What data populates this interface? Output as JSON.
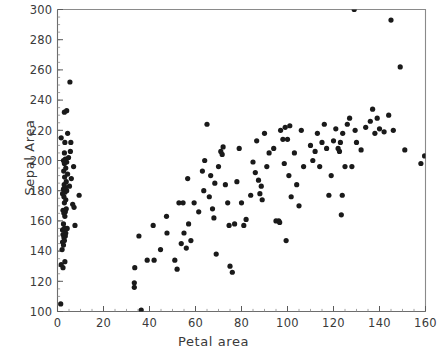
{
  "chart_data": {
    "type": "scatter",
    "title": "",
    "xlabel": "Petal area",
    "ylabel": "Sepal Area",
    "xlim": [
      0,
      160
    ],
    "ylim": [
      100,
      300
    ],
    "xticks": [
      0,
      20,
      40,
      60,
      80,
      100,
      120,
      140,
      160
    ],
    "yticks": [
      100,
      120,
      140,
      160,
      180,
      200,
      220,
      240,
      260,
      280,
      300
    ],
    "xtick_labels": [
      "0",
      "20",
      "40",
      "60",
      "80",
      "100",
      "120",
      "140",
      "160"
    ],
    "ytick_labels": [
      "100",
      "120",
      "140",
      "160",
      "180",
      "200",
      "220",
      "240",
      "260",
      "280",
      "300"
    ],
    "minor_tick_step_x": 5,
    "minor_tick_step_y": 5,
    "grid": false,
    "legend": null,
    "marker": "filled-circle",
    "marker_color": "#1a1a1a",
    "marker_size": 2.6,
    "frame_color": "#8a8a8a",
    "points": [
      [
        1.4,
        105
      ],
      [
        1.6,
        131
      ],
      [
        2.4,
        129
      ],
      [
        3.2,
        133
      ],
      [
        2.0,
        141
      ],
      [
        2.6,
        144
      ],
      [
        2.2,
        146
      ],
      [
        3.0,
        147
      ],
      [
        2.8,
        149
      ],
      [
        3.4,
        150
      ],
      [
        2.4,
        151
      ],
      [
        3.6,
        152
      ],
      [
        2.2,
        154
      ],
      [
        3.0,
        155
      ],
      [
        4.2,
        155
      ],
      [
        7.6,
        157
      ],
      [
        2.6,
        158
      ],
      [
        3.2,
        163
      ],
      [
        2.8,
        165
      ],
      [
        3.4,
        166
      ],
      [
        2.4,
        167
      ],
      [
        3.8,
        168
      ],
      [
        7.2,
        169
      ],
      [
        6.6,
        171
      ],
      [
        3.0,
        172
      ],
      [
        3.6,
        174
      ],
      [
        2.8,
        176
      ],
      [
        9.4,
        177
      ],
      [
        2.2,
        178
      ],
      [
        3.2,
        179
      ],
      [
        4.0,
        180
      ],
      [
        2.6,
        181
      ],
      [
        3.4,
        182
      ],
      [
        5.2,
        183
      ],
      [
        2.9,
        184
      ],
      [
        3.8,
        186
      ],
      [
        6.0,
        188
      ],
      [
        3.1,
        189
      ],
      [
        4.4,
        191
      ],
      [
        2.7,
        193
      ],
      [
        3.6,
        195
      ],
      [
        7.0,
        196
      ],
      [
        3.0,
        198
      ],
      [
        4.0,
        199
      ],
      [
        2.6,
        200
      ],
      [
        3.4,
        201
      ],
      [
        4.8,
        202
      ],
      [
        3.0,
        205
      ],
      [
        5.6,
        206
      ],
      [
        3.2,
        212
      ],
      [
        5.8,
        212
      ],
      [
        1.6,
        215
      ],
      [
        4.4,
        218
      ],
      [
        3.0,
        232
      ],
      [
        4.0,
        233
      ],
      [
        5.4,
        252
      ],
      [
        33.4,
        116
      ],
      [
        33.4,
        119
      ],
      [
        33.6,
        129
      ],
      [
        36.4,
        101
      ],
      [
        39.0,
        134
      ],
      [
        42.0,
        134
      ],
      [
        35.4,
        150
      ],
      [
        41.6,
        157
      ],
      [
        44.8,
        141
      ],
      [
        47.6,
        152
      ],
      [
        47.4,
        163
      ],
      [
        51.0,
        134
      ],
      [
        52.0,
        128
      ],
      [
        52.8,
        172
      ],
      [
        54.6,
        172
      ],
      [
        53.8,
        145
      ],
      [
        55.0,
        152
      ],
      [
        56.0,
        142
      ],
      [
        57.0,
        158
      ],
      [
        58.0,
        147
      ],
      [
        56.6,
        188
      ],
      [
        59.4,
        172
      ],
      [
        61.4,
        166
      ],
      [
        63.0,
        193
      ],
      [
        63.6,
        180
      ],
      [
        64.0,
        200
      ],
      [
        65.0,
        224
      ],
      [
        66.0,
        176
      ],
      [
        66.6,
        190
      ],
      [
        67.4,
        168
      ],
      [
        68.0,
        162
      ],
      [
        68.4,
        185
      ],
      [
        69.0,
        138
      ],
      [
        70.0,
        196
      ],
      [
        71.0,
        206
      ],
      [
        71.6,
        204
      ],
      [
        72.0,
        209
      ],
      [
        73.0,
        184
      ],
      [
        74.0,
        172
      ],
      [
        74.6,
        157
      ],
      [
        75.0,
        130
      ],
      [
        76.0,
        126
      ],
      [
        77.0,
        158
      ],
      [
        78.0,
        186
      ],
      [
        79.0,
        208
      ],
      [
        80.0,
        172
      ],
      [
        81.0,
        157
      ],
      [
        82.0,
        161
      ],
      [
        84.0,
        177
      ],
      [
        85.0,
        199
      ],
      [
        86.0,
        192
      ],
      [
        86.6,
        213
      ],
      [
        87.4,
        187
      ],
      [
        88.0,
        178
      ],
      [
        88.6,
        183
      ],
      [
        89.0,
        174
      ],
      [
        90.0,
        218
      ],
      [
        91.0,
        196
      ],
      [
        92.0,
        205
      ],
      [
        94.0,
        208
      ],
      [
        95.0,
        160
      ],
      [
        96.2,
        160
      ],
      [
        96.6,
        159
      ],
      [
        97.0,
        220
      ],
      [
        98.0,
        214
      ],
      [
        98.6,
        198
      ],
      [
        99.0,
        222
      ],
      [
        99.4,
        147
      ],
      [
        100.0,
        214
      ],
      [
        100.6,
        190
      ],
      [
        101.0,
        223
      ],
      [
        101.6,
        176
      ],
      [
        103.0,
        205
      ],
      [
        104.0,
        184
      ],
      [
        105.0,
        170
      ],
      [
        106.0,
        220
      ],
      [
        107.0,
        196
      ],
      [
        110.0,
        210
      ],
      [
        111.0,
        200
      ],
      [
        112.0,
        206
      ],
      [
        113.0,
        218
      ],
      [
        114.0,
        196
      ],
      [
        115.0,
        212
      ],
      [
        116.0,
        224
      ],
      [
        117.0,
        208
      ],
      [
        118.0,
        177
      ],
      [
        119.0,
        190
      ],
      [
        120.0,
        213
      ],
      [
        121.0,
        221
      ],
      [
        122.0,
        208
      ],
      [
        122.6,
        206
      ],
      [
        123.0,
        212
      ],
      [
        123.4,
        164
      ],
      [
        123.8,
        177
      ],
      [
        124.0,
        218
      ],
      [
        125.0,
        196
      ],
      [
        126.0,
        224
      ],
      [
        127.0,
        228
      ],
      [
        128.0,
        196
      ],
      [
        129.0,
        300
      ],
      [
        129.4,
        220
      ],
      [
        130.0,
        212
      ],
      [
        132.0,
        207
      ],
      [
        134.0,
        222
      ],
      [
        136.0,
        226
      ],
      [
        137.0,
        234
      ],
      [
        138.0,
        218
      ],
      [
        139.0,
        228
      ],
      [
        140.0,
        221
      ],
      [
        142.0,
        219
      ],
      [
        144.0,
        230
      ],
      [
        145.0,
        293
      ],
      [
        146.0,
        220
      ],
      [
        149.0,
        262
      ],
      [
        151.0,
        207
      ],
      [
        158.0,
        198
      ],
      [
        159.6,
        203
      ]
    ]
  }
}
